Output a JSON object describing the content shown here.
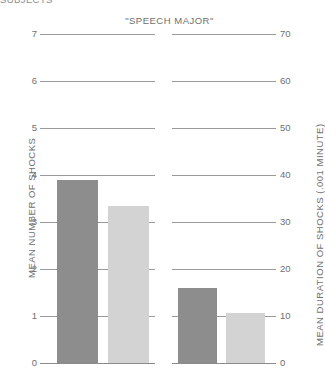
{
  "header": {
    "clipped_text": "SUBJECTS"
  },
  "chart_data": {
    "type": "bar",
    "title": "\"SPEECH MAJOR\"",
    "panels": [
      {
        "name": "mean-number-of-shocks",
        "axis": "left",
        "ylabel": "MEAN NUMBER OF SHOCKS",
        "ylim": [
          0,
          7
        ],
        "yticks": [
          0,
          1,
          2,
          3,
          4,
          5,
          6,
          7
        ],
        "ytick_labels": [
          "0",
          "1",
          "2",
          "3",
          "4",
          "5",
          "6",
          "7"
        ],
        "bars": [
          {
            "series": "dark",
            "value": 3.9,
            "color": "#8d8d8d"
          },
          {
            "series": "light",
            "value": 3.35,
            "color": "#d3d3d3"
          }
        ]
      },
      {
        "name": "mean-duration-of-shocks",
        "axis": "right",
        "ylabel": "MEAN DURATION OF SHOCKS (.001 MINUTE)",
        "ylim": [
          0,
          70
        ],
        "yticks": [
          0,
          10,
          20,
          30,
          40,
          50,
          60,
          70
        ],
        "ytick_labels": [
          "0",
          "10",
          "20",
          "30",
          "40",
          "50",
          "60",
          "70"
        ],
        "bars": [
          {
            "series": "dark",
            "value": 16.0,
            "color": "#8d8d8d"
          },
          {
            "series": "light",
            "value": 10.7,
            "color": "#d3d3d3"
          }
        ]
      }
    ],
    "grid": true,
    "legend": "none",
    "colors": {
      "dark_series": "#8d8d8d",
      "light_series": "#d3d3d3",
      "gridline": "#9a9a9a",
      "text": "#6f6f6f"
    }
  },
  "ticks_left": [
    "7",
    "6",
    "5",
    "4",
    "3",
    "2",
    "1",
    "0"
  ],
  "ticks_right": [
    "70",
    "60",
    "50",
    "40",
    "30",
    "20",
    "10",
    "0"
  ],
  "labels": {
    "left_axis_title": "MEAN NUMBER OF SHOCKS",
    "right_axis_title": "MEAN DURATION OF SHOCKS (.001 MINUTE)"
  }
}
